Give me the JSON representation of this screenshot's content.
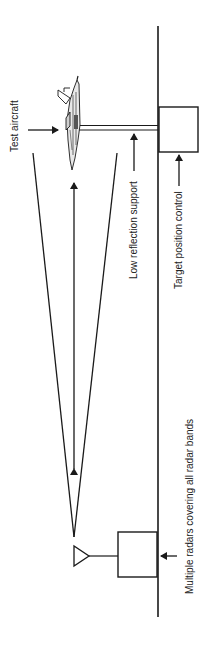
{
  "diagram": {
    "labels": {
      "test_aircraft": "Test aircraft",
      "low_reflection_support": "Low  reflection support",
      "target_position_control": "Target position control",
      "radars": "Multiple radars covering all radar bands"
    },
    "colors": {
      "stroke": "#1a1a1a",
      "background": "#ffffff",
      "text": "#222222"
    },
    "elements": [
      "ground-line",
      "test-aircraft",
      "low-reflection-support-rod",
      "target-position-control-box",
      "radar-beam-cone",
      "range-double-arrow",
      "radar-antenna",
      "radar-box"
    ]
  }
}
